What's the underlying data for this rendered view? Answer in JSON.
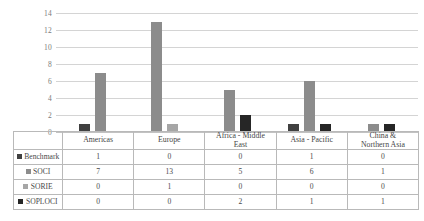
{
  "chart_data": {
    "type": "bar",
    "title": "",
    "xlabel": "",
    "ylabel": "",
    "ylim": [
      0,
      14
    ],
    "ytick_step": 2,
    "yticks": [
      "14",
      "12",
      "10",
      "8",
      "6",
      "4",
      "2",
      "0"
    ],
    "grid": true,
    "legend_position": "table-left",
    "categories": [
      "Americas",
      "Europe",
      "Africa - Middle East",
      "Asia - Pacific",
      "China & Northern Asia"
    ],
    "category_lines": [
      [
        "Americas"
      ],
      [
        "Europe"
      ],
      [
        "Africa - Middle",
        "East"
      ],
      [
        "Asia - Pacific"
      ],
      [
        "China &",
        "Northern Asia"
      ]
    ],
    "series": [
      {
        "name": "Benchmark",
        "color": "#404040",
        "values": [
          1,
          0,
          0,
          1,
          0
        ]
      },
      {
        "name": "SOCI",
        "color": "#8c8c8c",
        "values": [
          7,
          13,
          5,
          6,
          1
        ]
      },
      {
        "name": "SORIE",
        "color": "#a6a6a6",
        "values": [
          0,
          1,
          0,
          0,
          0
        ]
      },
      {
        "name": "SOPLOCI",
        "color": "#262626",
        "values": [
          0,
          0,
          2,
          1,
          1
        ]
      }
    ]
  },
  "colors": {
    "gridline": "#d4d4d4",
    "axis_text": "#7b7b7b",
    "table_border": "#b9b9b9",
    "table_text": "#4a4a4a"
  }
}
